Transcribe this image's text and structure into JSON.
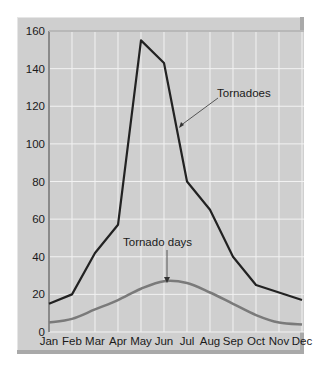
{
  "chart_data": {
    "type": "line",
    "title": "",
    "xlabel": "",
    "ylabel": "",
    "categories": [
      "Jan",
      "Feb",
      "Mar",
      "Apr",
      "May",
      "Jun",
      "Jul",
      "Aug",
      "Sep",
      "Oct",
      "Nov",
      "Dec"
    ],
    "series": [
      {
        "name": "Tornadoes",
        "color": "#222222",
        "values": [
          15,
          20,
          42,
          57,
          155,
          143,
          80,
          65,
          40,
          25,
          21,
          17
        ]
      },
      {
        "name": "Tornado days",
        "color": "#7a7a7a",
        "values": [
          5,
          7,
          12,
          17,
          23,
          27,
          26,
          21,
          15,
          9,
          5,
          4
        ]
      }
    ],
    "yticks": [
      0,
      20,
      40,
      60,
      80,
      100,
      120,
      140,
      160
    ],
    "ylim": [
      0,
      160
    ],
    "grid": true,
    "annotations": [
      {
        "text": "Tornadoes",
        "target_series": "Tornadoes"
      },
      {
        "text": "Tornado days",
        "target_series": "Tornado days"
      }
    ],
    "background": "#cfcfcf",
    "gridline_color": "#f2f2f2"
  }
}
